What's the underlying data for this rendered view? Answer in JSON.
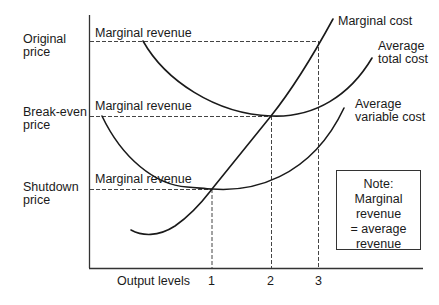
{
  "diagram": {
    "type": "cost-curves",
    "y_labels": {
      "original_price": [
        "Original",
        "price"
      ],
      "break_even_price": [
        "Break-even",
        "price"
      ],
      "shutdown_price": [
        "Shutdown",
        "price"
      ]
    },
    "marginal_revenue_labels": [
      "Marginal revenue",
      "Marginal revenue",
      "Marginal revenue"
    ],
    "curve_labels": {
      "marginal_cost": "Marginal cost",
      "average_total_cost": [
        "Average",
        "total cost"
      ],
      "average_variable_cost": [
        "Average",
        "variable cost"
      ]
    },
    "x_axis": {
      "label": "Output levels",
      "ticks": [
        "1",
        "2",
        "3"
      ]
    },
    "note": [
      "Note:",
      "Marginal",
      "revenue",
      "= average",
      "revenue"
    ]
  }
}
